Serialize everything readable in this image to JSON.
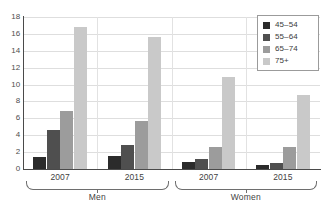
{
  "chart_data": {
    "type": "bar",
    "title": "",
    "xlabel": "",
    "ylabel": "",
    "ylim": [
      0,
      18
    ],
    "ytick_step": 2,
    "yticks": [
      18,
      16,
      14,
      12,
      10,
      8,
      6,
      4,
      2,
      0
    ],
    "grid": true,
    "legend_position": "top-right",
    "categories": [
      "2007",
      "2015",
      "2007",
      "2015"
    ],
    "group_labels": [
      "Men",
      "Women"
    ],
    "groups": [
      {
        "name": "Men",
        "periods": [
          {
            "label": "2007",
            "values": [
              1.4,
              4.6,
              6.9,
              16.8
            ]
          },
          {
            "label": "2015",
            "values": [
              1.5,
              2.8,
              5.7,
              15.6
            ]
          }
        ]
      },
      {
        "name": "Women",
        "periods": [
          {
            "label": "2007",
            "values": [
              0.85,
              1.15,
              2.6,
              10.9
            ]
          },
          {
            "label": "2015",
            "values": [
              0.45,
              0.75,
              2.6,
              8.8
            ]
          }
        ]
      }
    ],
    "series": [
      {
        "name": "45–54",
        "color": "#2b2b2b",
        "values": [
          1.4,
          1.5,
          0.85,
          0.45
        ]
      },
      {
        "name": "55–64",
        "color": "#4f4f4f",
        "values": [
          4.6,
          2.8,
          1.15,
          0.75
        ]
      },
      {
        "name": "65–74",
        "color": "#9c9c9c",
        "values": [
          6.9,
          5.7,
          2.6,
          2.6
        ]
      },
      {
        "name": "75+",
        "color": "#c9c9c9",
        "values": [
          16.8,
          15.6,
          10.9,
          8.8
        ]
      }
    ]
  },
  "legend": {
    "items": [
      {
        "label": "45–54",
        "color": "#2b2b2b"
      },
      {
        "label": "55–64",
        "color": "#4f4f4f"
      },
      {
        "label": "65–74",
        "color": "#9c9c9c"
      },
      {
        "label": "75+",
        "color": "#c9c9c9"
      }
    ]
  },
  "axis": {
    "y_labels": [
      "18",
      "16",
      "14",
      "12",
      "10",
      "8",
      "6",
      "4",
      "2",
      "0"
    ]
  },
  "category_labels": {
    "men_2007": "2007",
    "men_2015": "2015",
    "women_2007": "2007",
    "women_2015": "2015",
    "men": "Men",
    "women": "Women"
  },
  "colors": {
    "axis": "#4a4a4a",
    "grid": "#dedede",
    "legend_border": "#9b9b9b",
    "bracket": "#6e6e6e",
    "text": "#3a3a3a",
    "background": "#ffffff"
  }
}
